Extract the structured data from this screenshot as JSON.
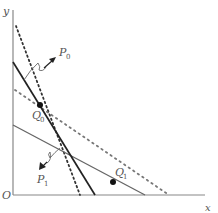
{
  "axes": {
    "y_label": "y",
    "x_label": "x",
    "origin_label": "O"
  },
  "labels": {
    "p0": {
      "main": "P",
      "sub": "0"
    },
    "p1": {
      "main": "P",
      "sub": "1"
    },
    "q0": {
      "main": "Q",
      "sub": "0"
    },
    "q1": {
      "main": "Q",
      "sub": "1"
    }
  },
  "colors": {
    "axis": "#888888",
    "solid_dark": "#222222",
    "solid_gray": "#666666",
    "dotted_dense": "#333333",
    "dotted_sparse": "#777777",
    "point": "#111111"
  }
}
